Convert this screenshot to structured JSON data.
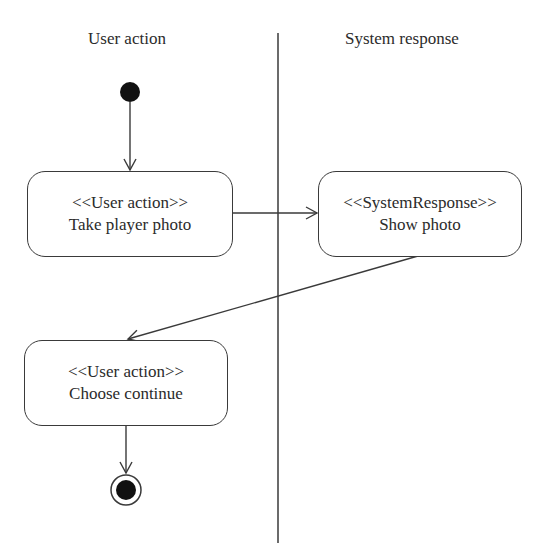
{
  "diagram": {
    "type": "UML activity diagram with swimlanes",
    "lanes": [
      {
        "id": "user",
        "title": "User action"
      },
      {
        "id": "system",
        "title": "System response"
      }
    ],
    "nodes": [
      {
        "id": "start",
        "kind": "initial",
        "lane": "user"
      },
      {
        "id": "a1",
        "kind": "action",
        "lane": "user",
        "stereotype": "<<User action>>",
        "label": "Take player photo"
      },
      {
        "id": "a2",
        "kind": "action",
        "lane": "system",
        "stereotype": "<<SystemResponse>>",
        "label": "Show photo"
      },
      {
        "id": "a3",
        "kind": "action",
        "lane": "user",
        "stereotype": "<<User action>>",
        "label": "Choose continue"
      },
      {
        "id": "end",
        "kind": "final",
        "lane": "user"
      }
    ],
    "edges": [
      {
        "from": "start",
        "to": "a1"
      },
      {
        "from": "a1",
        "to": "a2"
      },
      {
        "from": "a2",
        "to": "a3"
      },
      {
        "from": "a3",
        "to": "end"
      }
    ],
    "colors": {
      "stroke": "#3a3a3a",
      "fill": "#111111",
      "background": "#ffffff"
    }
  }
}
